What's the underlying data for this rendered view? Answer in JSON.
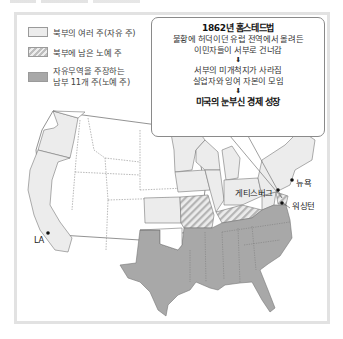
{
  "legend": {
    "items": [
      {
        "key": "free",
        "label": "북부의 여러 주(자유 주)"
      },
      {
        "key": "border",
        "label": "북부에 남은 노예 주"
      },
      {
        "key": "south",
        "label_line1": "자유무역을 주장하는",
        "label_line2": "남부 11개 주(노예 주)"
      }
    ]
  },
  "callout": {
    "title": "1862년 홈스테드법",
    "line1": "불황에 허덕이던 유럽 전역에서 몰려든",
    "line2": "이민자들이 서부로 건너감",
    "arrow1": "⬇",
    "line3": "서부의 미개척지가 사라짐",
    "line4": "실업자와 잉여 자본이 모임",
    "arrow2": "⬇",
    "result": "미국의 눈부신 경제 성장"
  },
  "map_labels": {
    "la": "LA",
    "gettysburg": "게티스버그",
    "new_york": "뉴욕",
    "washington": "워싱턴"
  },
  "colors": {
    "free_states": "#ececec",
    "border_states": "#bdbdbd",
    "south_states": "#a8a8a8",
    "territories": "#ffffff",
    "outline": "#777777"
  }
}
